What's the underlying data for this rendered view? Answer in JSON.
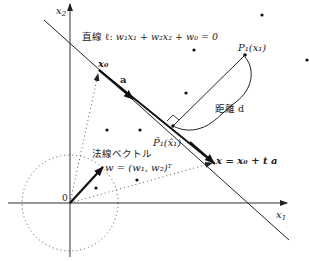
{
  "axes": {
    "x_label": "x",
    "x_sub": "1",
    "y_label": "x",
    "y_sub": "2",
    "origin_label": "0"
  },
  "line_label": {
    "prefix": "直線 ℓ: ",
    "equation": "w₁x₁ + w₂x₂ + w₀ = 0"
  },
  "x0_label": "x₀",
  "a_label": "a",
  "point_label": "P₁(x₁)",
  "foot_label": "P̂₁(x̂₁)",
  "distance_label": "距離 d",
  "normal_label": "法線ベクトル",
  "normal_equation": "w = (w₁, w₂)ᵀ",
  "param_equation": "x = x₀ + t a",
  "colors": {
    "ink": "#222222",
    "dotted": "#555555"
  }
}
